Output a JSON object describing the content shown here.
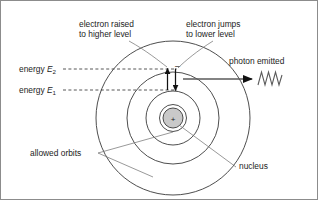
{
  "diagram": {
    "type": "schematic",
    "colors": {
      "stroke": "#333333",
      "leader": "#555555",
      "nucleus_fill": "#c9c9c9",
      "nucleus_stroke": "#4a4a4a",
      "dashed": "#444444",
      "arrow": "#111111",
      "wave": "#555555",
      "border": "#8c8c8c",
      "background": "#ffffff"
    },
    "labels": {
      "electron_raised_line1": "electron raised",
      "electron_raised_line2": "to higher level",
      "electron_jumps_line1": "electron jumps",
      "electron_jumps_line2": "to lower level",
      "photon_emitted": "photon emitted",
      "energy_2_prefix": "energy ",
      "energy_2_symbol": "E",
      "energy_2_subscript": "2",
      "energy_1_prefix": "energy ",
      "energy_1_symbol": "E",
      "energy_1_subscript": "1",
      "allowed_orbits": "allowed orbits",
      "nucleus": "nucleus",
      "nucleus_charge": "+",
      "electron_charge": "–"
    },
    "geometry": {
      "center_x": 172,
      "center_y": 117,
      "orbit_radii": [
        13,
        27,
        46,
        77
      ],
      "nucleus_radius": 10,
      "energy_level_2_y": 68,
      "energy_level_1_y": 89,
      "dashed_x_start": 62,
      "dashed_x_end": 176,
      "photon_arrow_x_start": 182,
      "photon_arrow_x_end": 252,
      "photon_arrow_y": 78,
      "wave_cycles": 3.5
    },
    "elements": [
      {
        "name": "orbit-outer",
        "kind": "circle",
        "radius": 77
      },
      {
        "name": "orbit-third",
        "kind": "circle",
        "radius": 46
      },
      {
        "name": "orbit-second",
        "kind": "circle",
        "radius": 27
      },
      {
        "name": "orbit-inner",
        "kind": "circle",
        "radius": 13
      },
      {
        "name": "nucleus",
        "kind": "filled-circle",
        "radius": 10
      },
      {
        "name": "arrow-up",
        "kind": "arrow",
        "direction": "up",
        "meaning": "electron raised to higher level"
      },
      {
        "name": "arrow-down",
        "kind": "arrow",
        "direction": "down",
        "meaning": "electron jumps to lower level"
      },
      {
        "name": "photon-arrow",
        "kind": "arrow",
        "direction": "right",
        "meaning": "photon emitted"
      },
      {
        "name": "photon-wave",
        "kind": "wave",
        "meaning": "emitted electromagnetic radiation"
      }
    ]
  }
}
